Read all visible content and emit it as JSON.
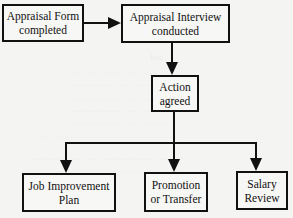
{
  "diagram": {
    "type": "flowchart",
    "nodes": [
      {
        "id": "form",
        "line1": "Appraisal Form",
        "line2": "completed"
      },
      {
        "id": "interview",
        "line1": "Appraisal Interview",
        "line2": "conducted"
      },
      {
        "id": "action",
        "line1": "Action",
        "line2": "agreed"
      },
      {
        "id": "job",
        "line1": "Job Improvement",
        "line2": "Plan"
      },
      {
        "id": "promotion",
        "line1": "Promotion",
        "line2": "or Transfer"
      },
      {
        "id": "salary",
        "line1": "Salary",
        "line2": "Review"
      }
    ],
    "edges": [
      {
        "from": "form",
        "to": "interview"
      },
      {
        "from": "interview",
        "to": "action"
      },
      {
        "from": "action",
        "to": "job"
      },
      {
        "from": "action",
        "to": "promotion"
      },
      {
        "from": "action",
        "to": "salary"
      }
    ],
    "colors": {
      "line": "#111111",
      "background": "#f4f4f2",
      "box_fill": "#f7f7f5"
    }
  }
}
